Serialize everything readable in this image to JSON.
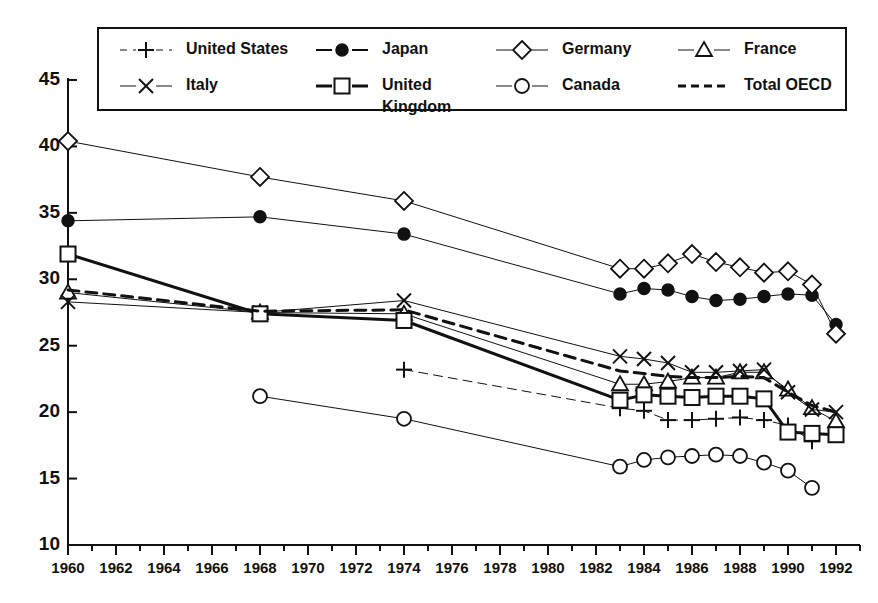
{
  "chart_data": {
    "type": "line",
    "title": "",
    "subtitle": "",
    "xlabel": "",
    "ylabel": "",
    "xlim": [
      1960,
      1993
    ],
    "ylim": [
      10,
      45
    ],
    "yticks": [
      10,
      15,
      20,
      25,
      30,
      35,
      40,
      45
    ],
    "xticks": [
      1960,
      1962,
      1964,
      1966,
      1968,
      1970,
      1972,
      1974,
      1976,
      1978,
      1980,
      1982,
      1984,
      1986,
      1988,
      1990,
      1992
    ],
    "xtick_minor_step": 1,
    "grid": false,
    "legend_position": "top",
    "legend_border": true,
    "axis_color": "#111111",
    "series": [
      {
        "name": "United States",
        "marker": "plus",
        "line_style": "dashed",
        "line_width": 1,
        "color": "#111111",
        "x": [
          1974,
          1983,
          1984,
          1985,
          1986,
          1987,
          1988,
          1989,
          1990,
          1991
        ],
        "values": [
          23.2,
          20.3,
          20.1,
          19.4,
          19.4,
          19.5,
          19.6,
          19.4,
          19.0,
          17.8
        ]
      },
      {
        "name": "Japan",
        "marker": "filled-circle",
        "line_style": "solid",
        "line_width": 1,
        "color": "#111111",
        "x": [
          1960,
          1968,
          1974,
          1983,
          1984,
          1985,
          1986,
          1987,
          1988,
          1989,
          1990,
          1991,
          1992
        ],
        "values": [
          34.4,
          34.7,
          33.4,
          28.9,
          29.3,
          29.2,
          28.7,
          28.4,
          28.5,
          28.7,
          28.9,
          28.8,
          26.6
        ]
      },
      {
        "name": "Germany",
        "marker": "open-diamond",
        "line_style": "solid",
        "line_width": 1,
        "color": "#111111",
        "x": [
          1960,
          1968,
          1974,
          1983,
          1984,
          1985,
          1986,
          1987,
          1988,
          1989,
          1990,
          1991,
          1992
        ],
        "values": [
          40.4,
          37.7,
          35.9,
          30.8,
          30.8,
          31.2,
          31.9,
          31.3,
          30.9,
          30.5,
          30.6,
          29.6,
          25.9
        ]
      },
      {
        "name": "France",
        "marker": "open-triangle",
        "line_style": "solid",
        "line_width": 1,
        "color": "#111111",
        "x": [
          1960,
          1968,
          1974,
          1983,
          1984,
          1985,
          1986,
          1987,
          1988,
          1989,
          1990,
          1991,
          1992
        ],
        "values": [
          29.0,
          27.5,
          27.4,
          22.1,
          22.1,
          22.3,
          22.6,
          22.6,
          23.0,
          23.0,
          21.7,
          20.3,
          19.3
        ]
      },
      {
        "name": "Italy",
        "marker": "cross",
        "line_style": "solid",
        "line_width": 1,
        "color": "#111111",
        "x": [
          1960,
          1968,
          1974,
          1983,
          1984,
          1985,
          1986,
          1987,
          1988,
          1989,
          1990,
          1991,
          1992
        ],
        "values": [
          28.3,
          27.5,
          28.4,
          24.2,
          24.0,
          23.7,
          23.0,
          23.0,
          23.1,
          23.2,
          21.5,
          20.2,
          20.0
        ]
      },
      {
        "name": "United Kingdom",
        "marker": "open-square",
        "line_style": "solid",
        "line_width": 3,
        "color": "#111111",
        "x": [
          1960,
          1968,
          1974,
          1983,
          1984,
          1985,
          1986,
          1987,
          1988,
          1989,
          1990,
          1991,
          1992
        ],
        "values": [
          31.9,
          27.4,
          26.9,
          20.9,
          21.3,
          21.2,
          21.1,
          21.2,
          21.2,
          21.0,
          18.5,
          18.4,
          18.3
        ]
      },
      {
        "name": "Canada",
        "marker": "open-circle",
        "line_style": "solid",
        "line_width": 1,
        "color": "#111111",
        "x": [
          1968,
          1974,
          1983,
          1984,
          1985,
          1986,
          1987,
          1988,
          1989,
          1990,
          1991
        ],
        "values": [
          21.2,
          19.5,
          15.9,
          16.4,
          16.6,
          16.7,
          16.8,
          16.7,
          16.2,
          15.6,
          14.3
        ]
      },
      {
        "name": "Total OECD",
        "marker": "none",
        "line_style": "dashed",
        "line_width": 3,
        "color": "#111111",
        "x": [
          1960,
          1968,
          1974,
          1983,
          1984,
          1985,
          1986,
          1987,
          1988,
          1989,
          1990,
          1991,
          1992
        ],
        "values": [
          29.2,
          27.6,
          27.7,
          23.1,
          22.9,
          22.7,
          22.6,
          22.6,
          22.7,
          22.6,
          21.5,
          20.5,
          20.0
        ]
      }
    ],
    "legend_entries": [
      {
        "label": "United States",
        "marker": "plus",
        "line_style": "dashed",
        "line_width": 1
      },
      {
        "label": "Japan",
        "marker": "filled-circle",
        "line_style": "solid",
        "line_width": 2
      },
      {
        "label": "Germany",
        "marker": "open-diamond",
        "line_style": "solid",
        "line_width": 1
      },
      {
        "label": "France",
        "marker": "open-triangle",
        "line_style": "solid",
        "line_width": 1
      },
      {
        "label": "Italy",
        "marker": "cross",
        "line_style": "solid",
        "line_width": 1
      },
      {
        "label": "United Kingdom",
        "marker": "open-square",
        "line_style": "solid",
        "line_width": 3
      },
      {
        "label": "Canada",
        "marker": "open-circle",
        "line_style": "solid",
        "line_width": 1
      },
      {
        "label": "Total OECD",
        "marker": "none",
        "line_style": "dashed",
        "line_width": 3
      }
    ]
  },
  "legend": {
    "row1": [
      {
        "label": "United States"
      },
      {
        "label": "Japan"
      },
      {
        "label": "Germany"
      },
      {
        "label": "France"
      }
    ],
    "row2": [
      {
        "label": "Italy"
      },
      {
        "label": "United",
        "label2": "Kingdom"
      },
      {
        "label": "Canada"
      },
      {
        "label": "Total OECD"
      }
    ]
  }
}
